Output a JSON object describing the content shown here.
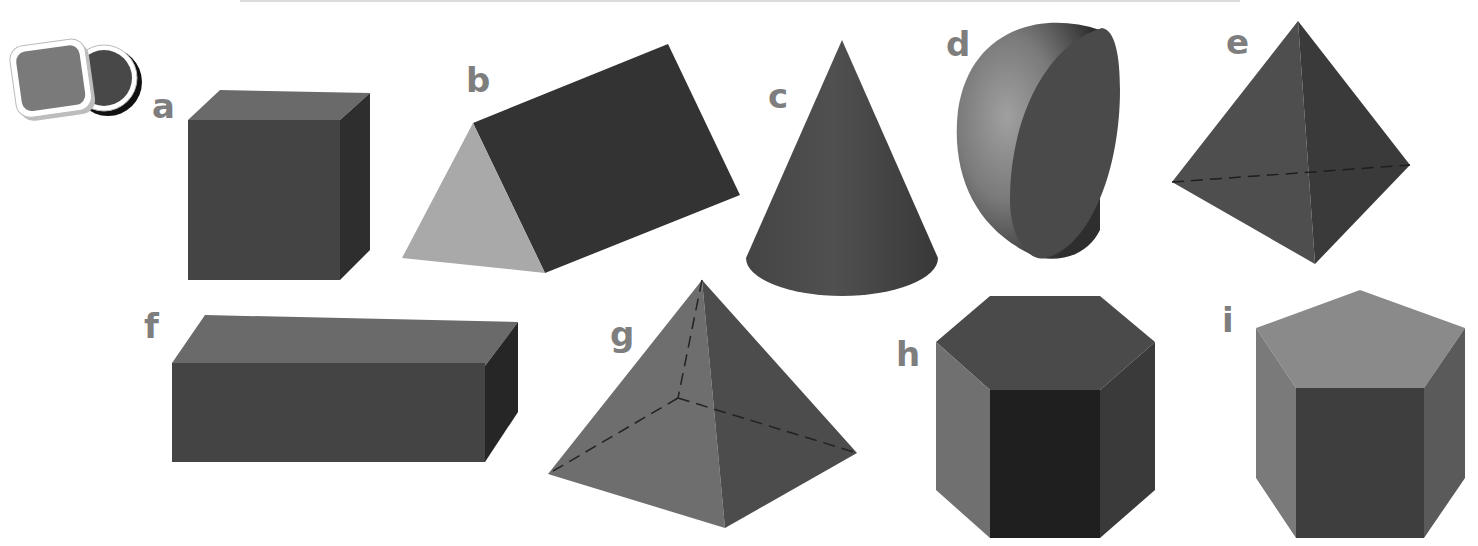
{
  "figure": {
    "icon": "shapes-icon",
    "colors": {
      "label": "#7e7e7e",
      "dark": "#3a3a3a",
      "mid": "#555555",
      "light": "#6e6e6e",
      "lighter": "#8c8c8c",
      "lightest": "#a9a9a9",
      "black": "#1f1f1f"
    },
    "shapes": [
      {
        "label": "a",
        "name": "cube"
      },
      {
        "label": "b",
        "name": "triangular prism"
      },
      {
        "label": "c",
        "name": "cone"
      },
      {
        "label": "d",
        "name": "hemisphere"
      },
      {
        "label": "e",
        "name": "triangular pyramid"
      },
      {
        "label": "f",
        "name": "cuboid"
      },
      {
        "label": "g",
        "name": "square-based pyramid"
      },
      {
        "label": "h",
        "name": "hexagonal prism"
      },
      {
        "label": "i",
        "name": "pentagonal prism"
      }
    ]
  }
}
